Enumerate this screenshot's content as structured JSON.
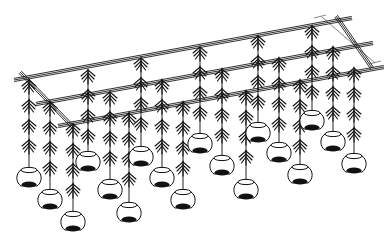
{
  "figure": {
    "type": "isometric line drawing",
    "colors": {
      "line": "#111111",
      "background": "#ffffff"
    },
    "dimension_label": "~",
    "frame": {
      "rails": [
        {
          "name": "back-rail",
          "x1": 14,
          "y1": 80,
          "x2": 352,
          "y2": 18
        },
        {
          "name": "middle-rail",
          "x1": 36,
          "y1": 104,
          "x2": 373,
          "y2": 43
        },
        {
          "name": "front-rail",
          "x1": 58,
          "y1": 126,
          "x2": 384,
          "y2": 67
        },
        {
          "name": "left-cross-rail",
          "x1": 20,
          "y1": 72,
          "x2": 74,
          "y2": 128
        },
        {
          "name": "right-cross-rail",
          "x1": 336,
          "y1": 16,
          "x2": 372,
          "y2": 68
        }
      ],
      "dimension_line": {
        "x1": 322,
        "y1": 17,
        "x2": 375,
        "y2": 63
      }
    },
    "strands": [
      {
        "x": 29,
        "top": 80,
        "sprigs": [
          80,
          100,
          120,
          140
        ],
        "pot_y": 168
      },
      {
        "x": 50,
        "top": 102,
        "sprigs": [
          102,
          122,
          142,
          162
        ],
        "pot_y": 190
      },
      {
        "x": 73,
        "top": 124,
        "sprigs": [
          124,
          144,
          164,
          184
        ],
        "pot_y": 212
      },
      {
        "x": 88,
        "top": 70,
        "sprigs": [
          70,
          90,
          110,
          130
        ],
        "pot_y": 152
      },
      {
        "x": 110,
        "top": 92,
        "sprigs": [
          92,
          112,
          132,
          152
        ],
        "pot_y": 180
      },
      {
        "x": 129,
        "top": 113,
        "sprigs": [
          113,
          133,
          153,
          173
        ],
        "pot_y": 203
      },
      {
        "x": 141,
        "top": 58,
        "sprigs": [
          58,
          78,
          98,
          118
        ],
        "pot_y": 147
      },
      {
        "x": 162,
        "top": 80,
        "sprigs": [
          80,
          100,
          120,
          140
        ],
        "pot_y": 168
      },
      {
        "x": 183,
        "top": 102,
        "sprigs": [
          102,
          122,
          142,
          162
        ],
        "pot_y": 190
      },
      {
        "x": 200,
        "top": 47,
        "sprigs": [
          47,
          67,
          87,
          107
        ],
        "pot_y": 134
      },
      {
        "x": 222,
        "top": 69,
        "sprigs": [
          69,
          89,
          109,
          129
        ],
        "pot_y": 156
      },
      {
        "x": 246,
        "top": 91,
        "sprigs": [
          91,
          111,
          131,
          151
        ],
        "pot_y": 180
      },
      {
        "x": 258,
        "top": 36,
        "sprigs": [
          36,
          56,
          76,
          96
        ],
        "pot_y": 123
      },
      {
        "x": 279,
        "top": 58,
        "sprigs": [
          58,
          78,
          98,
          118
        ],
        "pot_y": 143
      },
      {
        "x": 300,
        "top": 80,
        "sprigs": [
          80,
          100,
          120,
          140
        ],
        "pot_y": 165
      },
      {
        "x": 312,
        "top": 26,
        "sprigs": [
          26,
          46,
          66,
          86
        ],
        "pot_y": 111
      },
      {
        "x": 333,
        "top": 47,
        "sprigs": [
          47,
          67,
          87,
          107
        ],
        "pot_y": 132
      },
      {
        "x": 354,
        "top": 68,
        "sprigs": [
          68,
          88,
          108,
          128
        ],
        "pot_y": 154
      }
    ]
  }
}
